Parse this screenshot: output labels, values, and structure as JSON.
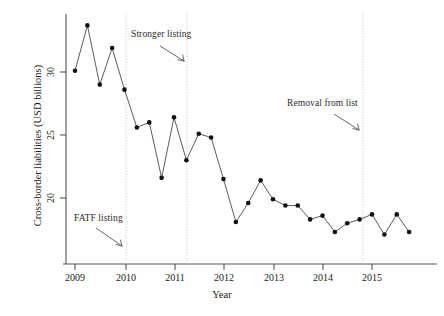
{
  "chart_data": {
    "type": "line",
    "title": "",
    "xlabel": "Year",
    "ylabel": "Cross-border liabilities (USD billions)",
    "xlim": [
      2008.88,
      2015.95
    ],
    "ylim": [
      16.8,
      34.6
    ],
    "grid": false,
    "legend": null,
    "xticks": [
      "2009",
      "2010",
      "2011",
      "2012",
      "2013",
      "2014",
      "2015"
    ],
    "xtick_values": [
      2009,
      2010,
      2011,
      2012,
      2013,
      2014,
      2015
    ],
    "yticks": [
      "30",
      "25",
      "20"
    ],
    "ytick_values": [
      30,
      25,
      20
    ],
    "marker": "filled-circle",
    "line_style": "solid-thin",
    "series": [
      {
        "name": "Cross-border liabilities",
        "x": [
          2009.0,
          2009.25,
          2009.5,
          2009.75,
          2010.0,
          2010.25,
          2010.5,
          2010.75,
          2011.0,
          2011.25,
          2011.5,
          2011.75,
          2012.0,
          2012.25,
          2012.5,
          2012.75,
          2013.0,
          2013.25,
          2013.5,
          2013.75,
          2014.0,
          2014.25,
          2014.5,
          2014.75,
          2015.0,
          2015.25,
          2015.5,
          2015.75
        ],
        "values": [
          30.1,
          33.7,
          29.0,
          31.9,
          28.6,
          25.6,
          26.0,
          21.6,
          26.4,
          23.0,
          25.1,
          24.8,
          21.5,
          18.1,
          19.6,
          21.4,
          19.9,
          19.4,
          19.4,
          18.3,
          18.6,
          17.3,
          18.0,
          18.3,
          18.7,
          17.1,
          18.7,
          17.3
        ]
      }
    ],
    "vertical_event_lines": [
      {
        "label": "FATF listing",
        "x": 2010.0
      },
      {
        "label": "Stronger listing",
        "x": 2011.25
      },
      {
        "label": "Removal from list",
        "x": 2014.8
      }
    ],
    "annotations": [
      {
        "id": "fatf",
        "text": "FATF listing",
        "arrow_to_x": 2010.0
      },
      {
        "id": "stronger",
        "text": "Stronger listing",
        "arrow_to_x": 2011.25
      },
      {
        "id": "removal",
        "text": "Removal from list",
        "arrow_to_x": 2014.8
      }
    ],
    "colors": {
      "marker": "#111111",
      "line": "#444444",
      "axis": "#555555",
      "event_line": "#bbbbbb",
      "text": "#1a1a1a",
      "background": "#ffffff"
    }
  }
}
